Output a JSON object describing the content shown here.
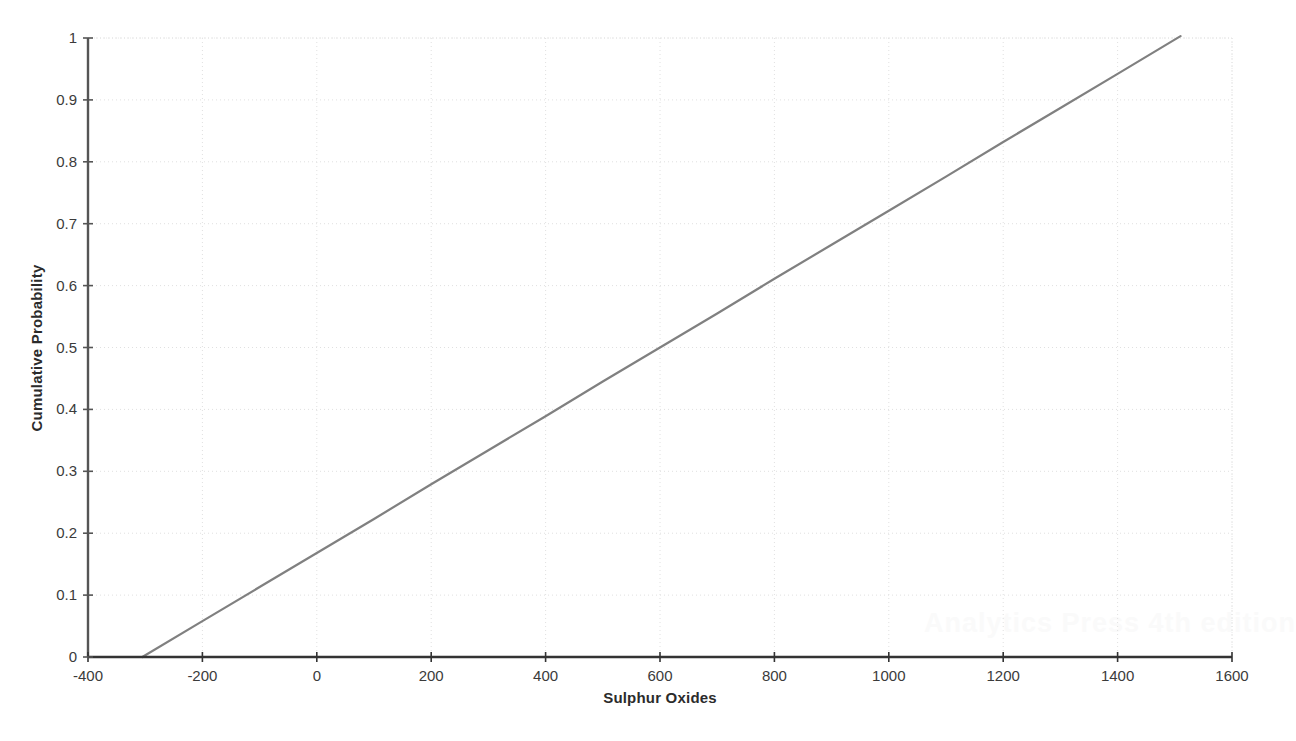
{
  "chart_data": {
    "type": "line",
    "title": "",
    "subtitle": "",
    "xlabel": "Sulphur Oxides",
    "ylabel": "Cumulative Probability",
    "xlim": [
      -400,
      1600
    ],
    "ylim": [
      0,
      1
    ],
    "grid": true,
    "legend": null,
    "xticks": [
      -400,
      -200,
      0,
      200,
      400,
      600,
      800,
      1000,
      1200,
      1400,
      1600
    ],
    "xtick_labels": [
      "-400",
      "-200",
      "0",
      "200",
      "400",
      "600",
      "800",
      "1000",
      "1200",
      "1400",
      "1600"
    ],
    "yticks": [
      0,
      0.1,
      0.2,
      0.3,
      0.4,
      0.5,
      0.6,
      0.7,
      0.8,
      0.9,
      1
    ],
    "ytick_labels": [
      "0",
      "0.1",
      "0.2",
      "0.3",
      "0.4",
      "0.5",
      "0.6",
      "0.7",
      "0.8",
      "0.9",
      "1"
    ],
    "series": [
      {
        "name": "Cumulative Probability",
        "color": "#808080",
        "x": [
          -305,
          -200,
          -100,
          0,
          100,
          200,
          300,
          400,
          500,
          600,
          700,
          800,
          900,
          1000,
          1100,
          1200,
          1300,
          1400,
          1510
        ],
        "values": [
          0.0,
          0.058,
          0.113,
          0.168,
          0.223,
          0.279,
          0.334,
          0.389,
          0.445,
          0.5,
          0.555,
          0.611,
          0.666,
          0.721,
          0.776,
          0.832,
          0.887,
          0.942,
          1.003
        ]
      }
    ],
    "annotations": []
  },
  "axes": {
    "x_axis_color": "#333333",
    "y_axis_color": "#555555",
    "grid_color": "#e0e0e0",
    "line_color": "#808080"
  },
  "watermark": {
    "text": "Analytics Press 4th edition",
    "color": "#fafafa"
  }
}
